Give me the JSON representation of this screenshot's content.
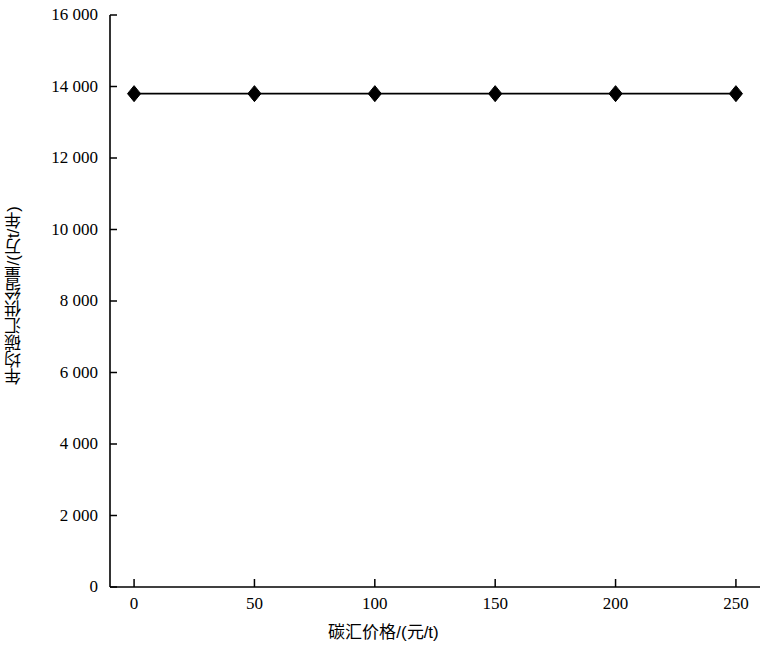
{
  "chart_data": {
    "type": "line",
    "title": "",
    "subtitle": "",
    "xlabel": "碳汇价格/(元/t)",
    "ylabel": "年均碳汇供给量/(万t/年)",
    "x": [
      0,
      50,
      100,
      150,
      200,
      250
    ],
    "series": [
      {
        "name": "年均碳汇供给量",
        "values": [
          13800,
          13800,
          13800,
          13800,
          13800,
          13800
        ],
        "marker": "diamond",
        "color": "#000000"
      }
    ],
    "xlim": [
      -10,
      260
    ],
    "ylim": [
      0,
      16000
    ],
    "x_ticks": [
      0,
      50,
      100,
      150,
      200,
      250
    ],
    "x_tick_labels": [
      "0",
      "50",
      "100",
      "150",
      "200",
      "250"
    ],
    "y_ticks": [
      0,
      2000,
      4000,
      6000,
      8000,
      10000,
      12000,
      14000,
      16000
    ],
    "y_tick_labels": [
      "0",
      "2 000",
      "4 000",
      "6 000",
      "8 000",
      "10 000",
      "12 000",
      "14 000",
      "16 000"
    ],
    "grid": false,
    "legend": null,
    "legend_position": "none",
    "annotations": [],
    "background_color": "#ffffff",
    "axis_color": "#000000"
  }
}
